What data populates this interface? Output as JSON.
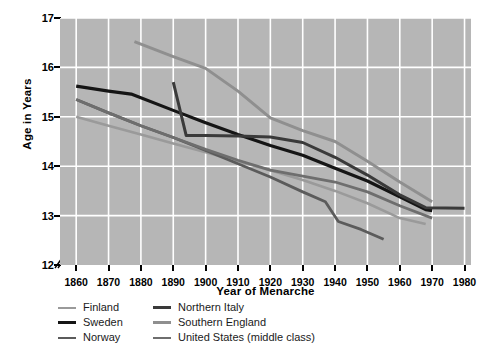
{
  "chart_data": {
    "type": "line",
    "title": "",
    "xlabel": "Year of Menarche",
    "ylabel": "Age in Years",
    "xlim": [
      1855,
      1982
    ],
    "ylim": [
      12,
      17
    ],
    "xticks": [
      1860,
      1870,
      1880,
      1890,
      1900,
      1910,
      1920,
      1930,
      1940,
      1950,
      1960,
      1970,
      1980
    ],
    "yticks": [
      12,
      13,
      14,
      15,
      16,
      17
    ],
    "grid": true,
    "y_axis_break": true,
    "legend_position": "below-plot",
    "legend_columns": 2,
    "plot_background": "#b6b6b6",
    "gridline_color": "#ffffff",
    "series": [
      {
        "name": "Finland",
        "color": "#9a9a9a",
        "width": 2.6,
        "x": [
          1860,
          1870,
          1880,
          1890,
          1900,
          1910,
          1920,
          1930,
          1940,
          1950,
          1960,
          1968
        ],
        "y": [
          15.0,
          14.82,
          14.64,
          14.46,
          14.28,
          14.1,
          13.92,
          13.72,
          13.5,
          13.25,
          12.95,
          12.83
        ]
      },
      {
        "name": "Sweden",
        "color": "#151515",
        "width": 3.2,
        "x": [
          1860,
          1870,
          1877,
          1890,
          1900,
          1910,
          1920,
          1930,
          1940,
          1950,
          1960,
          1968,
          1970
        ],
        "y": [
          15.62,
          15.52,
          15.46,
          15.13,
          14.88,
          14.64,
          14.42,
          14.22,
          13.96,
          13.7,
          13.38,
          13.12,
          13.1
        ]
      },
      {
        "name": "Norway",
        "color": "#5b5b5b",
        "width": 2.8,
        "x": [
          1860,
          1870,
          1880,
          1890,
          1900,
          1910,
          1920,
          1930,
          1937,
          1941,
          1948,
          1955
        ],
        "y": [
          15.35,
          15.08,
          14.82,
          14.58,
          14.32,
          14.05,
          13.78,
          13.48,
          13.28,
          12.88,
          12.72,
          12.52
        ]
      },
      {
        "name": "Northern Italy",
        "color": "#3a3a3a",
        "width": 3.0,
        "x": [
          1890,
          1894,
          1900,
          1910,
          1920,
          1930,
          1940,
          1950,
          1960,
          1968,
          1980
        ],
        "y": [
          15.7,
          14.62,
          14.62,
          14.61,
          14.59,
          14.48,
          14.18,
          13.82,
          13.42,
          13.16,
          13.15
        ]
      },
      {
        "name": "Southern England",
        "color": "#8f8f8f",
        "width": 3.0,
        "x": [
          1878,
          1890,
          1900,
          1910,
          1920,
          1930,
          1940,
          1950,
          1960,
          1970
        ],
        "y": [
          16.52,
          16.22,
          15.98,
          15.52,
          14.98,
          14.72,
          14.5,
          14.1,
          13.68,
          13.28
        ]
      },
      {
        "name": "United States (middle class)",
        "color": "#6e6e6e",
        "width": 2.8,
        "x": [
          1860,
          1870,
          1880,
          1890,
          1900,
          1910,
          1920,
          1930,
          1940,
          1950,
          1960,
          1970
        ],
        "y": [
          15.35,
          15.08,
          14.82,
          14.58,
          14.34,
          14.12,
          13.92,
          13.8,
          13.68,
          13.48,
          13.2,
          12.95
        ]
      }
    ]
  },
  "legend": {
    "columns": [
      {
        "items": [
          {
            "label": "Finland",
            "color": "#9a9a9a",
            "width": 2.6
          },
          {
            "label": "Sweden",
            "color": "#151515",
            "width": 3.4
          },
          {
            "label": "Norway",
            "color": "#5b5b5b",
            "width": 2.8
          }
        ]
      },
      {
        "items": [
          {
            "label": "Northern Italy",
            "color": "#3a3a3a",
            "width": 3.0
          },
          {
            "label": "Southern England",
            "color": "#8f8f8f",
            "width": 3.0
          },
          {
            "label": "United States (middle class)",
            "color": "#6e6e6e",
            "width": 2.8
          }
        ]
      }
    ]
  }
}
